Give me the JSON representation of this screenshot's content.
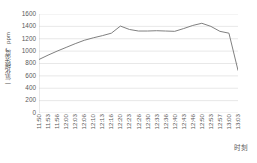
{
  "chart_data": {
    "type": "line",
    "title": "",
    "xlabel": "时刻",
    "ylabel": "一氧化碳浓度，ppm",
    "ylim": [
      0,
      1600
    ],
    "ytick_step": 200,
    "yticks": [
      0,
      200,
      400,
      600,
      800,
      1000,
      1200,
      1400,
      1600
    ],
    "grid": true,
    "legend": false,
    "line_color": "#808080",
    "grid_color": "#d9d9d9",
    "axis_color": "#bfbfbf",
    "background": "#ffffff",
    "categories": [
      "11:50",
      "11:53",
      "11:56",
      "12:00",
      "12:03",
      "12:06",
      "12:10",
      "12:13",
      "12:16",
      "12:20",
      "12:23",
      "12:26",
      "12:30",
      "12:33",
      "12:36",
      "12:40",
      "12:43",
      "12:46",
      "12:50",
      "12:53",
      "12:57",
      "13:00",
      "13:03"
    ],
    "values": [
      865,
      935,
      1000,
      1060,
      1120,
      1175,
      1215,
      1250,
      1290,
      1405,
      1350,
      1325,
      1325,
      1330,
      1325,
      1320,
      1365,
      1415,
      1450,
      1400,
      1320,
      1290,
      690
    ]
  }
}
